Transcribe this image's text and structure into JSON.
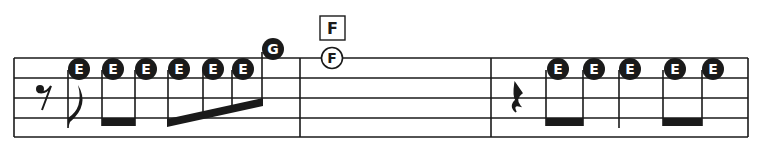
{
  "score": {
    "colors": {
      "ink": "#1a1a1a",
      "paper": "#ffffff",
      "note_text": "#ffffff"
    },
    "chord_box": {
      "label": "F"
    },
    "measures": [
      {
        "index": 1,
        "rest": "eighth-rest",
        "notes": [
          {
            "label": "E",
            "style": "filled"
          },
          {
            "label": "E",
            "style": "filled"
          },
          {
            "label": "E",
            "style": "filled"
          },
          {
            "label": "E",
            "style": "filled"
          },
          {
            "label": "E",
            "style": "filled"
          },
          {
            "label": "E",
            "style": "filled"
          },
          {
            "label": "G",
            "style": "filled"
          }
        ]
      },
      {
        "index": 2,
        "notes": [
          {
            "label": "F",
            "style": "outline",
            "duration": "whole"
          }
        ]
      },
      {
        "index": 3,
        "rest": "quarter-rest",
        "notes": [
          {
            "label": "E",
            "style": "filled"
          },
          {
            "label": "E",
            "style": "filled"
          },
          {
            "label": "E",
            "style": "filled"
          },
          {
            "label": "E",
            "style": "filled"
          },
          {
            "label": "E",
            "style": "filled"
          }
        ]
      }
    ]
  }
}
